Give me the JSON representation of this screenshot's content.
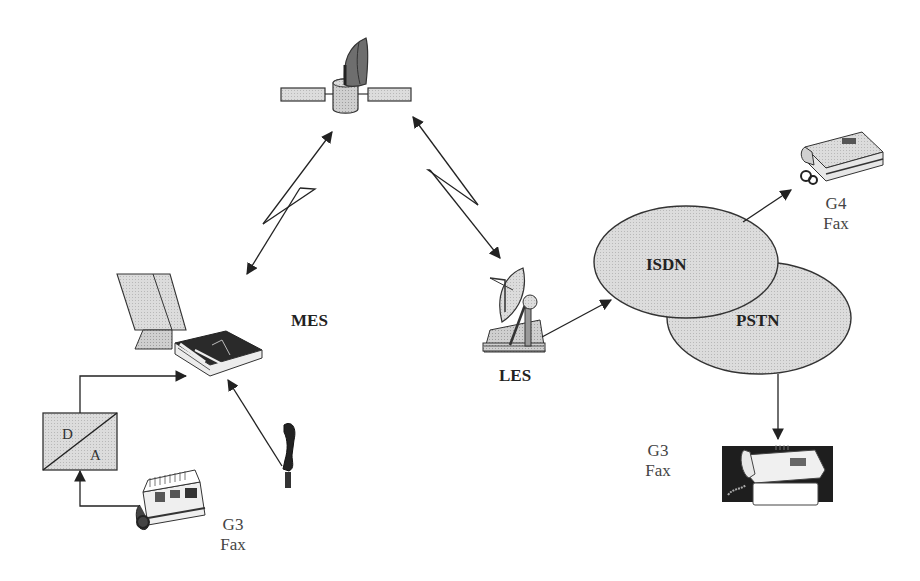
{
  "diagram": {
    "type": "satellite-fax-network",
    "colors": {
      "line": "#222222",
      "fill_light": "#d9d9d9",
      "fill_mid": "#bdbdbd",
      "fill_dark": "#333333",
      "background": "#ffffff"
    },
    "nodes": {
      "satellite": {
        "label": ""
      },
      "mes": {
        "label": "MES"
      },
      "les": {
        "label": "LES"
      },
      "isdn": {
        "label": "ISDN"
      },
      "pstn": {
        "label": "PSTN"
      },
      "da_converter": {
        "top": "D",
        "bottom": "A"
      },
      "g3_fax_left": {
        "line1": "G3",
        "line2": "Fax"
      },
      "g4_fax": {
        "line1": "G4",
        "line2": "Fax"
      },
      "g3_fax_right": {
        "line1": "G3",
        "line2": "Fax"
      },
      "handset": {
        "label": ""
      }
    },
    "edges": [
      {
        "from": "mes",
        "to": "satellite",
        "style": "bidirectional-lightning"
      },
      {
        "from": "satellite",
        "to": "les",
        "style": "bidirectional-lightning"
      },
      {
        "from": "les",
        "to": "isdn",
        "style": "arrow"
      },
      {
        "from": "isdn",
        "to": "g4_fax",
        "style": "arrow"
      },
      {
        "from": "pstn",
        "to": "g3_fax_right",
        "style": "arrow"
      },
      {
        "from": "g3_fax_left",
        "to": "da_converter",
        "style": "arrow"
      },
      {
        "from": "da_converter",
        "to": "mes",
        "style": "arrow"
      },
      {
        "from": "handset",
        "to": "mes",
        "style": "arrow"
      }
    ]
  }
}
